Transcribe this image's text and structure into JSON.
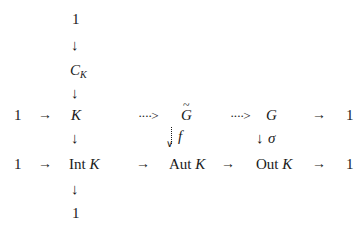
{
  "diagram": {
    "type": "commutative-diagram",
    "nodes": {
      "top_one": "1",
      "center": {
        "base": "C",
        "sub": "K"
      },
      "k": "K",
      "g_tilde": "G",
      "g": "G",
      "int_k": {
        "op": "Int",
        "arg": "K"
      },
      "aut_k": {
        "op": "Aut",
        "arg": "K"
      },
      "out_k": {
        "op": "Out",
        "arg": "K"
      },
      "left_one_row1": "1",
      "right_one_row1": "1",
      "left_one_row2": "1",
      "right_one_row2": "1",
      "bottom_one": "1"
    },
    "arrows": {
      "solid_right": "→",
      "solid_down": "↓",
      "dotted_right": "····>",
      "f_label": "f",
      "sigma_label": "σ",
      "dotted_down_head": "∨"
    }
  }
}
